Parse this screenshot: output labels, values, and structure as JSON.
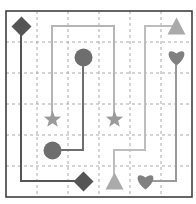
{
  "board": {
    "cols": 6,
    "rows": 6,
    "origin": [
      6,
      11
    ],
    "cell": 31,
    "border_color": "#333333",
    "grid_color": "#aaaaaa"
  },
  "pieces": [
    {
      "shape": "diamond",
      "col": 0,
      "row": 0,
      "color": "#555555"
    },
    {
      "shape": "circle",
      "col": 2,
      "row": 1,
      "color": "#6e6e6e"
    },
    {
      "shape": "triangle",
      "col": 5,
      "row": 0,
      "color": "#aaaaaa"
    },
    {
      "shape": "heart",
      "col": 5,
      "row": 1,
      "color": "#808080"
    },
    {
      "shape": "star",
      "col": 1,
      "row": 3,
      "color": "#9a9a9a"
    },
    {
      "shape": "star",
      "col": 3,
      "row": 3,
      "color": "#9a9a9a"
    },
    {
      "shape": "circle",
      "col": 1,
      "row": 4,
      "color": "#6e6e6e"
    },
    {
      "shape": "diamond",
      "col": 2,
      "row": 5,
      "color": "#555555"
    },
    {
      "shape": "triangle",
      "col": 3,
      "row": 5,
      "color": "#aaaaaa"
    },
    {
      "shape": "heart",
      "col": 4,
      "row": 5,
      "color": "#808080"
    }
  ],
  "paths": [
    {
      "pair": "diamond",
      "color": "#555555",
      "points": [
        [
          21,
          26
        ],
        [
          21,
          181
        ],
        [
          83,
          181
        ]
      ]
    },
    {
      "pair": "circle",
      "color": "#6e6e6e",
      "points": [
        [
          83,
          57
        ],
        [
          83,
          150
        ],
        [
          52,
          150
        ]
      ]
    },
    {
      "pair": "star",
      "color": "#b5b5b5",
      "points": [
        [
          52,
          119
        ],
        [
          52,
          26
        ],
        [
          114,
          26
        ],
        [
          114,
          119
        ]
      ]
    },
    {
      "pair": "triangle",
      "color": "#bdbdbd",
      "points": [
        [
          176,
          26
        ],
        [
          145,
          26
        ],
        [
          145,
          150
        ],
        [
          114,
          150
        ],
        [
          114,
          181
        ]
      ]
    },
    {
      "pair": "heart",
      "color": "#9a9a9a",
      "points": [
        [
          176,
          57
        ],
        [
          176,
          181
        ],
        [
          145,
          181
        ]
      ]
    }
  ]
}
